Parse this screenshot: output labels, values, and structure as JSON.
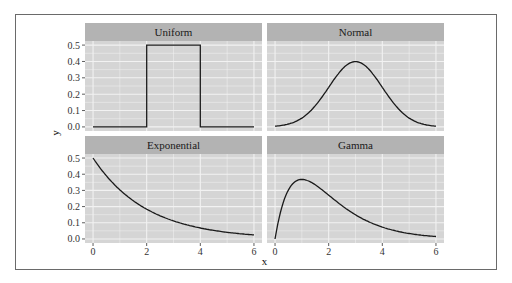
{
  "chart_data": {
    "type": "line",
    "layout": "facet_wrap 2x2",
    "xlabel": "x",
    "ylabel": "y",
    "xlim": [
      0,
      6
    ],
    "ylim": [
      0,
      0.5
    ],
    "x_ticks": [
      "0",
      "2",
      "4",
      "6"
    ],
    "y_ticks": [
      "0.0",
      "0.1",
      "0.2",
      "0.3",
      "0.4",
      "0.5"
    ],
    "grid": true,
    "legend": "none",
    "panels": [
      {
        "title": "Uniform",
        "description": "Uniform(2,4) density",
        "x": [
          0,
          2,
          2,
          4,
          4,
          6
        ],
        "y": [
          0,
          0,
          0.5,
          0.5,
          0,
          0
        ]
      },
      {
        "title": "Normal",
        "description": "Normal(mean=3, sd=1) density",
        "x": [
          0,
          1,
          2,
          3,
          4,
          5,
          6
        ],
        "y": [
          0.004,
          0.054,
          0.242,
          0.399,
          0.242,
          0.054,
          0.004
        ]
      },
      {
        "title": "Exponential",
        "description": "Exponential(rate=0.5) density",
        "x": [
          0,
          1,
          2,
          3,
          4,
          5,
          6
        ],
        "y": [
          0.5,
          0.303,
          0.184,
          0.112,
          0.068,
          0.041,
          0.025
        ]
      },
      {
        "title": "Gamma",
        "description": "Gamma(shape=2, rate=1) density",
        "x": [
          0,
          0.5,
          1,
          2,
          3,
          4,
          5,
          6
        ],
        "y": [
          0,
          0.303,
          0.368,
          0.271,
          0.149,
          0.073,
          0.034,
          0.015
        ]
      }
    ]
  },
  "colors": {
    "panel_bg": "#d5d5d5",
    "strip_bg": "#b3b3b3",
    "grid": "#f2f2f2",
    "line": "#1a1a1a"
  }
}
